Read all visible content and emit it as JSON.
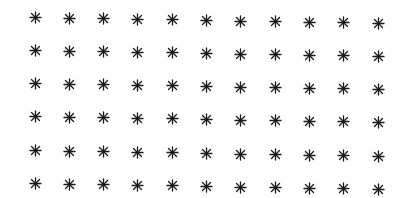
{
  "grid": {
    "rows": 6,
    "cols": 11,
    "symbol": "asterisk-icon",
    "color": "#1a1a1a",
    "background": "#ffffff",
    "col_x": [
      35,
      69,
      103,
      137,
      172,
      206,
      240,
      275,
      309,
      343,
      378
    ],
    "row_y": [
      17,
      50,
      83,
      116,
      150,
      183
    ],
    "row_slope_px": 6,
    "total_count": 66
  }
}
